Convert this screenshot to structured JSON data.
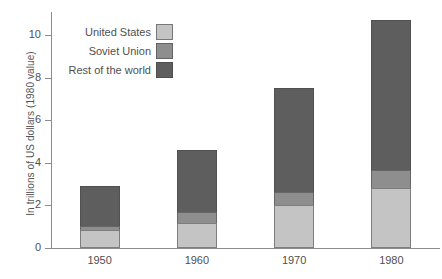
{
  "chart_data": {
    "type": "bar",
    "stacked": true,
    "title": "",
    "xlabel": "",
    "ylabel": "In trillions of US dollars (1980 value)",
    "categories": [
      "1950",
      "1960",
      "1970",
      "1980"
    ],
    "ylim": [
      0,
      11.1
    ],
    "yticks": [
      0,
      2,
      4,
      6,
      8,
      10
    ],
    "ytick_labels": [
      "0",
      "2",
      "4",
      "6",
      "8",
      "10"
    ],
    "grid": false,
    "legend_position": "top-left",
    "series": [
      {
        "name": "United States",
        "color": "#c4c4c4",
        "values": [
          0.85,
          1.2,
          2.0,
          2.8
        ]
      },
      {
        "name": "Soviet Union",
        "color": "#8e8e8e",
        "values": [
          0.25,
          0.55,
          0.7,
          0.9
        ]
      },
      {
        "name": "Rest of the world",
        "color": "#5e5e5e",
        "values": [
          1.9,
          2.95,
          4.9,
          7.1
        ]
      }
    ],
    "totals": [
      3.0,
      4.7,
      7.6,
      10.8
    ]
  },
  "axis": {
    "y_title": "In trillions of US dollars (1980 value)"
  },
  "legend": {
    "items": [
      {
        "label": "United States",
        "color": "#c4c4c4"
      },
      {
        "label": "Soviet Union",
        "color": "#8e8e8e"
      },
      {
        "label": "Rest of the world",
        "color": "#5e5e5e"
      }
    ]
  }
}
